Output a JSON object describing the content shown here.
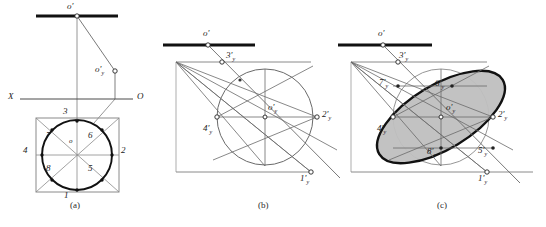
{
  "figure": {
    "background_color": "#ffffff",
    "line_color": "#555555",
    "heavy_line_color": "#111111",
    "fill_color": "#bfbfbf",
    "marker_fill": "#ffffff"
  },
  "panels": [
    {
      "id": "a",
      "caption": "(a)",
      "caption_x": 78,
      "caption_y": 205,
      "description": "Orthographic two-view layout: frontal trace with o', auxiliary point o'y, X-O ground line, and plan view square with inscribed circle carrying eight division points.",
      "labels": [
        {
          "name": "o-prime",
          "text": "o",
          "sub": "",
          "prime": "'",
          "x": 67,
          "y": 4
        },
        {
          "name": "o-prime-y",
          "text": "o",
          "sub": "y",
          "prime": "'",
          "x": 97,
          "y": 67
        },
        {
          "name": "axis-x",
          "text": "X",
          "sub": "",
          "prime": "",
          "x": 9,
          "y": 95
        },
        {
          "name": "axis-o",
          "text": "O",
          "sub": "",
          "prime": "",
          "x": 139,
          "y": 95
        },
        {
          "name": "point-3",
          "text": "3",
          "sub": "",
          "prime": "",
          "x": 64,
          "y": 110
        },
        {
          "name": "point-7",
          "text": "7",
          "sub": "",
          "prime": "",
          "x": 48,
          "y": 136
        },
        {
          "name": "point-6",
          "text": "6",
          "sub": "",
          "prime": "",
          "x": 88,
          "y": 136
        },
        {
          "name": "point-o",
          "text": "o",
          "sub": "",
          "prime": "",
          "x": 70,
          "y": 142
        },
        {
          "name": "point-4",
          "text": "4",
          "sub": "",
          "prime": "",
          "x": 24,
          "y": 150
        },
        {
          "name": "point-2",
          "text": "2",
          "sub": "",
          "prime": "",
          "x": 122,
          "y": 150
        },
        {
          "name": "point-8",
          "text": "8",
          "sub": "",
          "prime": "",
          "x": 48,
          "y": 168
        },
        {
          "name": "point-5",
          "text": "5",
          "sub": "",
          "prime": "",
          "x": 88,
          "y": 168
        },
        {
          "name": "point-1",
          "text": "1",
          "sub": "",
          "prime": "",
          "x": 64,
          "y": 190
        }
      ]
    },
    {
      "id": "b",
      "caption": "(b)",
      "caption_x": 264,
      "caption_y": 205,
      "description": "Axonometric construction stage: rhombus/parallelogram with inscribed true circle, centre o'y and the four axis points 1'y, 2'y, 3'y, 4'y located by projection rays from o'.",
      "labels": [
        {
          "name": "o-prime",
          "text": "o",
          "sub": "",
          "prime": "'",
          "x": 203,
          "y": 31
        },
        {
          "name": "point-3y",
          "text": "3",
          "sub": "y",
          "prime": "'",
          "x": 227,
          "y": 57
        },
        {
          "name": "point-o-y",
          "text": "o",
          "sub": "y",
          "prime": "'",
          "x": 270,
          "y": 108
        },
        {
          "name": "point-2y",
          "text": "2",
          "sub": "y",
          "prime": "'",
          "x": 327,
          "y": 117
        },
        {
          "name": "point-4y",
          "text": "4",
          "sub": "y",
          "prime": "'",
          "x": 208,
          "y": 131
        },
        {
          "name": "point-1y",
          "text": "1",
          "sub": "y",
          "prime": "'",
          "x": 295,
          "y": 178
        }
      ]
    },
    {
      "id": "c",
      "caption": "(c)",
      "caption_x": 443,
      "caption_y": 205,
      "description": "Completed stage: shaded elliptical projection of the circle drawn through the eight constructed points 1'y to 8'y inside the axonometric parallelogram.",
      "labels": [
        {
          "name": "o-prime",
          "text": "o",
          "sub": "",
          "prime": "'",
          "x": 378,
          "y": 31
        },
        {
          "name": "point-3y",
          "text": "3",
          "sub": "y",
          "prime": "'",
          "x": 400,
          "y": 58
        },
        {
          "name": "point-7y",
          "text": "7",
          "sub": "y",
          "prime": "'",
          "x": 383,
          "y": 84
        },
        {
          "name": "point-6y",
          "text": "6",
          "sub": "y",
          "prime": "'",
          "x": 437,
          "y": 86
        },
        {
          "name": "point-o-y",
          "text": "o",
          "sub": "y",
          "prime": "'",
          "x": 448,
          "y": 108
        },
        {
          "name": "point-2y",
          "text": "2",
          "sub": "y",
          "prime": "'",
          "x": 504,
          "y": 117
        },
        {
          "name": "point-4y",
          "text": "4",
          "sub": "y",
          "prime": "'",
          "x": 381,
          "y": 131
        },
        {
          "name": "point-8y",
          "text": "8",
          "sub": "y",
          "prime": "'",
          "x": 430,
          "y": 153
        },
        {
          "name": "point-5y",
          "text": "5",
          "sub": "y",
          "prime": "'",
          "x": 481,
          "y": 152
        },
        {
          "name": "point-1y",
          "text": "1",
          "sub": "y",
          "prime": "'",
          "x": 473,
          "y": 178
        }
      ]
    }
  ],
  "geometry": {
    "panel_a": {
      "heavy_trace": {
        "x1": 36,
        "y1": 16,
        "x2": 118,
        "y2": 16
      },
      "ground_line": {
        "x1": 14,
        "y1": 99,
        "x2": 135,
        "y2": 99
      },
      "vertical_from_o": {
        "x1": 77,
        "y1": 16,
        "x2": 77,
        "y2": 122
      },
      "ray_o_to_oy": {
        "x1": 77,
        "y1": 16,
        "x2": 115,
        "y2": 71
      },
      "vertical_oy": {
        "x1": 115,
        "y1": 71,
        "x2": 115,
        "y2": 99
      },
      "ray_oy_to_plan": {
        "x1": 115,
        "y1": 99,
        "x2": 96,
        "y2": 122
      },
      "square": {
        "x": 36,
        "y": 118,
        "w": 83,
        "h": 74
      },
      "circle": {
        "cx": 77,
        "cy": 155,
        "r": 35
      },
      "marker_points": [
        {
          "name": "o-prime-marker",
          "cx": 77,
          "cy": 16
        },
        {
          "name": "o-prime-y-marker",
          "cx": 115,
          "cy": 71
        },
        {
          "name": "point-3-marker",
          "cx": 77,
          "cy": 121
        },
        {
          "name": "point-1-marker",
          "cx": 77,
          "cy": 190
        },
        {
          "name": "point-4-marker",
          "cx": 42,
          "cy": 155
        },
        {
          "name": "point-2-marker",
          "cx": 112,
          "cy": 155
        },
        {
          "name": "point-7-marker",
          "cx": 52,
          "cy": 130
        },
        {
          "name": "point-6-marker",
          "cx": 102,
          "cy": 130
        },
        {
          "name": "point-8-marker",
          "cx": 52,
          "cy": 180
        },
        {
          "name": "point-5-marker",
          "cx": 102,
          "cy": 180
        }
      ]
    },
    "panel_b": {
      "heavy_trace": {
        "x1": 163,
        "y1": 45,
        "x2": 255,
        "y2": 45
      },
      "o_prime": {
        "cx": 208,
        "cy": 45
      },
      "circle": {
        "cx": 265,
        "cy": 117,
        "r": 48
      },
      "apex": {
        "cx": 176,
        "cy": 62
      },
      "pt1": {
        "cx": 311,
        "cy": 172
      },
      "pt2": {
        "cx": 317,
        "cy": 117
      },
      "pt3": {
        "cx": 222,
        "cy": 62
      },
      "pt4": {
        "cx": 217,
        "cy": 117
      }
    },
    "panel_c": {
      "heavy_trace": {
        "x1": 338,
        "y1": 45,
        "x2": 432,
        "y2": 45
      },
      "o_prime": {
        "cx": 383,
        "cy": 45
      },
      "circle": {
        "cx": 441,
        "cy": 117,
        "r": 48
      },
      "apex": {
        "cx": 351,
        "cy": 62
      },
      "ellipse": {
        "cx": 441,
        "cy": 117,
        "rx": 72,
        "ry": 32,
        "rotation": -31
      }
    }
  }
}
